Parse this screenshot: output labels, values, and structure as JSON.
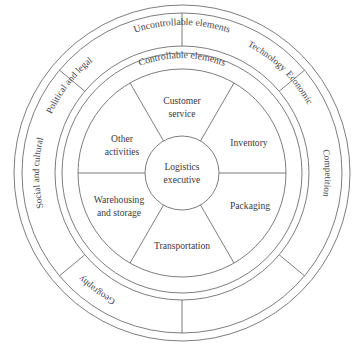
{
  "diagram": {
    "center_hub": {
      "line1": "Logistics",
      "line2": "executive"
    },
    "ring_titles": {
      "outer": "Uncontrollable elements",
      "inner": "Controllable elements"
    },
    "controllable_elements": [
      {
        "id": "customer-service",
        "line1": "Customer",
        "line2": "service"
      },
      {
        "id": "inventory",
        "line1": "Inventory",
        "line2": ""
      },
      {
        "id": "packaging",
        "line1": "Packaging",
        "line2": ""
      },
      {
        "id": "transportation",
        "line1": "Transportation",
        "line2": ""
      },
      {
        "id": "warehousing-and-storage",
        "line1": "Warehousing",
        "line2": "and storage"
      },
      {
        "id": "other-activities",
        "line1": "Other",
        "line2": "activities"
      }
    ],
    "uncontrollable_elements": [
      {
        "id": "economic",
        "label": "Economic"
      },
      {
        "id": "competition",
        "label": "Competition"
      },
      {
        "id": "technology",
        "label": "Technology"
      },
      {
        "id": "geography",
        "label": "Geography"
      },
      {
        "id": "social-and-cultural",
        "label": "Social and cultural"
      },
      {
        "id": "political-and-legal",
        "label": "Political and legal"
      }
    ],
    "colors": {
      "background": "#ffffff",
      "stroke": "#6e6e72",
      "text": "#3a3a3e"
    }
  }
}
